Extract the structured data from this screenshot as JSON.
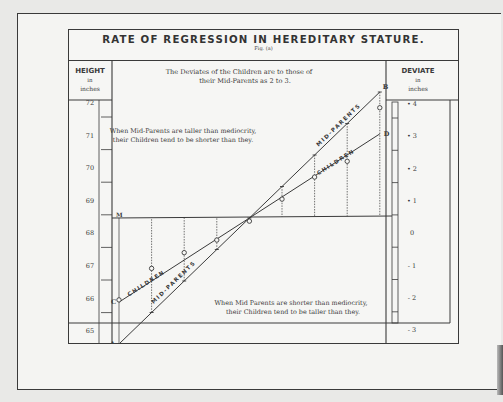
{
  "chart_data": {
    "type": "line",
    "title": "RATE OF REGRESSION IN HEREDITARY STATURE.",
    "subtitle": "Fig. (a)",
    "annotations": {
      "ratio": [
        "The Deviates of the Children are to those of",
        "their Mid-Parents as 2 to 3."
      ],
      "taller": [
        "When Mid-Parents are taller than mediocrity,",
        "their Children tend to be shorter than they."
      ],
      "shorter": [
        "When Mid Parents are shorter than mediocrity,",
        "their Children tend to be taller than they."
      ]
    },
    "left_axis": {
      "header": [
        "HEIGHT",
        "in",
        "inches"
      ],
      "ticks": [
        "72",
        "71",
        "70",
        "69",
        "68",
        "67",
        "66",
        "65"
      ],
      "range": [
        64.5,
        72.5
      ]
    },
    "right_axis": {
      "header": [
        "DEVIATE",
        "in",
        "inches"
      ],
      "ticks": [
        "+4",
        "+3",
        "+2",
        "+1",
        "0",
        "-1",
        "-2",
        "-3",
        "-4"
      ],
      "range": [
        -4,
        4
      ]
    },
    "point_labels": {
      "A": "A",
      "B": "B",
      "C": "C",
      "D": "D",
      "M": "M"
    },
    "line_labels": {
      "mid_parents": "MID-PARENTS",
      "children": "CHILDREN"
    },
    "mediocrity_height": 68.25,
    "series": [
      {
        "name": "MID-PARENTS",
        "description": "Line A-B, slope 1 (deviate of mid-parent)",
        "x_deviate": [
          -4,
          -3,
          -2,
          -1,
          0,
          1,
          2,
          3,
          4
        ],
        "y_deviate": [
          -4,
          -3,
          -2,
          -1,
          0,
          1,
          2,
          3,
          4
        ]
      },
      {
        "name": "CHILDREN",
        "description": "Line C-D, slope 2/3 (deviate of children)",
        "x_deviate": [
          -4,
          -3,
          -2,
          -1,
          0,
          1,
          2,
          3,
          4
        ],
        "y_deviate": [
          -2.67,
          -2,
          -1.33,
          -0.67,
          0,
          0.67,
          1.33,
          2,
          2.67
        ]
      },
      {
        "name": "Observed children means",
        "description": "Circle markers on the vertical guides",
        "x_deviate": [
          -4,
          -3,
          -2,
          -1,
          0,
          1,
          2,
          3,
          4
        ],
        "y_deviate": [
          -2.6,
          -1.6,
          -1.1,
          -0.7,
          -0.1,
          0.6,
          1.3,
          1.8,
          3.5
        ]
      }
    ]
  }
}
